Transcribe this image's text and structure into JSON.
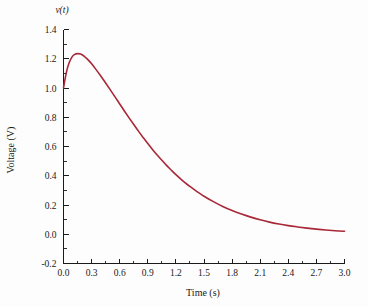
{
  "figure": {
    "background_color": "#fdfdfd",
    "axis_color": "#1a1a1a"
  },
  "chart_data": {
    "type": "line",
    "title": "",
    "subtitle": "",
    "xlabel": "Time (s)",
    "ylabel": "Voltage (V)",
    "curve_symbol": "v(t)",
    "series_color": "#a82838",
    "grid": false,
    "legend": null,
    "xlim": [
      0.0,
      3.0
    ],
    "ylim": [
      -0.2,
      1.4
    ],
    "xticks": [
      0.0,
      0.3,
      0.6,
      0.9,
      1.2,
      1.5,
      1.8,
      2.1,
      2.4,
      2.7,
      3.0
    ],
    "xtick_labels": [
      "0.0",
      "0.3",
      "0.6",
      "0.9",
      "1.2",
      "1.5",
      "1.8",
      "2.1",
      "2.4",
      "2.7",
      "3.0"
    ],
    "yticks": [
      -0.2,
      0.0,
      0.2,
      0.4,
      0.6,
      0.8,
      1.0,
      1.2,
      1.4
    ],
    "ytick_labels": [
      "-0.2",
      "0.0",
      "0.2",
      "0.4",
      "0.6",
      "0.8",
      "1.0",
      "1.2",
      "1.4"
    ],
    "minor_ticks": true,
    "series": [
      {
        "name": "v(t)",
        "x": [
          0.0,
          0.03,
          0.06,
          0.09,
          0.12,
          0.15,
          0.18,
          0.21,
          0.24,
          0.27,
          0.3,
          0.35,
          0.4,
          0.45,
          0.5,
          0.55,
          0.6,
          0.65,
          0.7,
          0.75,
          0.8,
          0.85,
          0.9,
          0.95,
          1.0,
          1.05,
          1.1,
          1.15,
          1.2,
          1.25,
          1.3,
          1.35,
          1.4,
          1.45,
          1.5,
          1.6,
          1.7,
          1.8,
          1.9,
          2.0,
          2.1,
          2.2,
          2.3,
          2.4,
          2.5,
          2.6,
          2.7,
          2.8,
          2.9,
          3.0
        ],
        "y": [
          1.0,
          1.105,
          1.172,
          1.211,
          1.23,
          1.235,
          1.232,
          1.222,
          1.206,
          1.187,
          1.165,
          1.124,
          1.08,
          1.034,
          0.987,
          0.939,
          0.891,
          0.843,
          0.796,
          0.75,
          0.705,
          0.662,
          0.62,
          0.58,
          0.542,
          0.506,
          0.471,
          0.439,
          0.408,
          0.379,
          0.352,
          0.327,
          0.303,
          0.281,
          0.26,
          0.223,
          0.19,
          0.162,
          0.138,
          0.117,
          0.099,
          0.083,
          0.07,
          0.059,
          0.05,
          0.042,
          0.035,
          0.029,
          0.024,
          0.02
        ]
      }
    ],
    "annotations": {
      "peak_value": 1.235,
      "peak_time": 0.15,
      "initial_value": 1.0,
      "final_value": 0.02
    }
  }
}
